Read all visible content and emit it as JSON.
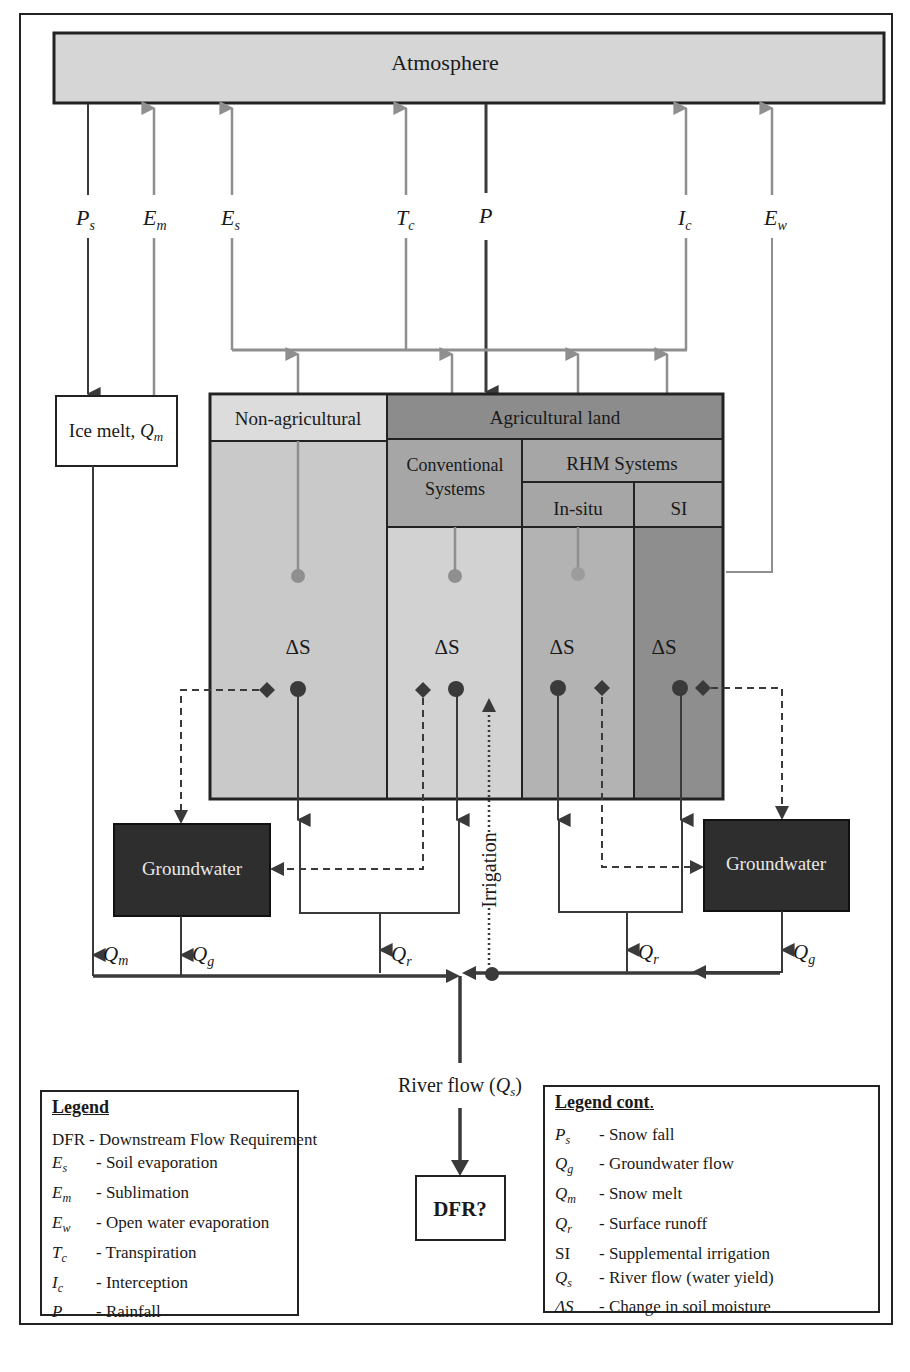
{
  "diagram": {
    "atmosphere": "Atmosphere",
    "flux_labels": {
      "ps": {
        "base": "P",
        "sub": "s"
      },
      "em": {
        "base": "E",
        "sub": "m"
      },
      "es": {
        "base": "E",
        "sub": "s"
      },
      "tc": {
        "base": "T",
        "sub": "c"
      },
      "p": {
        "base": "P",
        "sub": ""
      },
      "ic": {
        "base": "I",
        "sub": "c"
      },
      "ew": {
        "base": "E",
        "sub": "w"
      }
    },
    "ice_melt": {
      "text": "Ice melt, ",
      "sym": "Q",
      "sub": "m"
    },
    "land": {
      "non_agricultural": "Non-agricultural",
      "agricultural": "Agricultural land",
      "conventional": "Conventional Systems",
      "rhm": "RHM Systems",
      "in_situ": "In-situ",
      "si": "SI",
      "delta_s": "ΔS"
    },
    "groundwater_left": "Groundwater",
    "groundwater_right": "Groundwater",
    "irrigation": "Irrigation",
    "flow_labels": {
      "qm": {
        "base": "Q",
        "sub": "m"
      },
      "qg_left": {
        "base": "Q",
        "sub": "g"
      },
      "qr_left": {
        "base": "Q",
        "sub": "r"
      },
      "qr_right": {
        "base": "Q",
        "sub": "r"
      },
      "qg_right": {
        "base": "Q",
        "sub": "g"
      }
    },
    "river_flow": {
      "text": "River flow (",
      "sym": "Q",
      "sub": "s",
      "close": ")"
    },
    "dfr": "DFR?",
    "colors": {
      "atmosphere": "#d6d6d6",
      "non_ag_header": "#dcdcdc",
      "non_ag_body": "#c9c9c9",
      "ag_header": "#8c8c8c",
      "sub_header": "#a6a6a6",
      "conventional_body": "#d2d2d2",
      "insitu_body": "#b3b3b3",
      "si_body": "#8e8e8e",
      "groundwater": "#2e2e2e",
      "gray_arrow": "#8f8f8f",
      "dark_arrow": "#3a3a3a"
    }
  },
  "legend": {
    "title": "Legend",
    "items": [
      {
        "sym": "DFR",
        "sub": "",
        "upright": true,
        "desc": "- Downstream Flow Requirement"
      },
      {
        "sym": "E",
        "sub": "s",
        "desc": "- Soil evaporation"
      },
      {
        "sym": "E",
        "sub": "m",
        "desc": "-  Sublimation"
      },
      {
        "sym": "E",
        "sub": "w",
        "desc": "- Open water evaporation"
      },
      {
        "sym": "T",
        "sub": "c",
        "desc": "- Transpiration"
      },
      {
        "sym": "I",
        "sub": "c",
        "desc": "- Interception"
      },
      {
        "sym": "P",
        "sub": "",
        "desc": "- Rainfall"
      }
    ]
  },
  "legend_cont": {
    "title": "Legend cont",
    "title_suffix": ".",
    "items": [
      {
        "sym": "P",
        "sub": "s",
        "desc": "- Snow fall"
      },
      {
        "sym": "Q",
        "sub": "g",
        "desc": "- Groundwater flow"
      },
      {
        "sym": "Q",
        "sub": "m",
        "desc": "-  Snow melt"
      },
      {
        "sym": "Q",
        "sub": "r",
        "desc": "- Surface runoff"
      },
      {
        "sym": "SI",
        "sub": "",
        "upright": true,
        "desc": "- Supplemental irrigation"
      },
      {
        "sym": "Q",
        "sub": "s",
        "desc": "- River flow (water yield)"
      },
      {
        "sym": "ΔS",
        "sub": "",
        "desc": "- Change in soil moisture"
      }
    ]
  }
}
